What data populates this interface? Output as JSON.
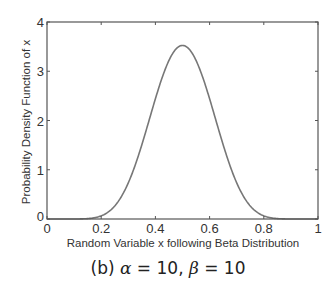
{
  "chart_data": {
    "type": "line",
    "title": "",
    "caption": "(b) α = 10, β = 10",
    "caption_parts": {
      "prefix": "(b) ",
      "alpha_sym": "α",
      "alpha_val": " = 10, ",
      "beta_sym": "β",
      "beta_val": " = 10"
    },
    "xlabel": "Random Variable x following Beta Distribution",
    "ylabel": "Probability Density Function of x",
    "xlim": [
      0,
      1
    ],
    "ylim": [
      0,
      4
    ],
    "xticks": [
      "0",
      "0.2",
      "0.4",
      "0.6",
      "0.8",
      "1"
    ],
    "yticks": [
      "0",
      "1",
      "2",
      "3",
      "4"
    ],
    "grid": false,
    "legend": null,
    "series": [
      {
        "name": "Beta(10,10) pdf",
        "color": "#777777",
        "x": [
          0,
          0.1,
          0.15,
          0.2,
          0.25,
          0.3,
          0.35,
          0.4,
          0.45,
          0.5,
          0.55,
          0.6,
          0.65,
          0.7,
          0.75,
          0.8,
          0.85,
          0.9,
          1
        ],
        "y": [
          0,
          0.0002,
          0.007,
          0.061,
          0.27,
          0.77,
          1.59,
          2.54,
          3.27,
          3.52,
          3.27,
          2.54,
          1.59,
          0.77,
          0.27,
          0.061,
          0.007,
          0.0002,
          0
        ]
      }
    ],
    "distribution": {
      "alpha": 10,
      "beta": 10,
      "peak_x": 0.5,
      "peak_y": 3.52
    }
  }
}
